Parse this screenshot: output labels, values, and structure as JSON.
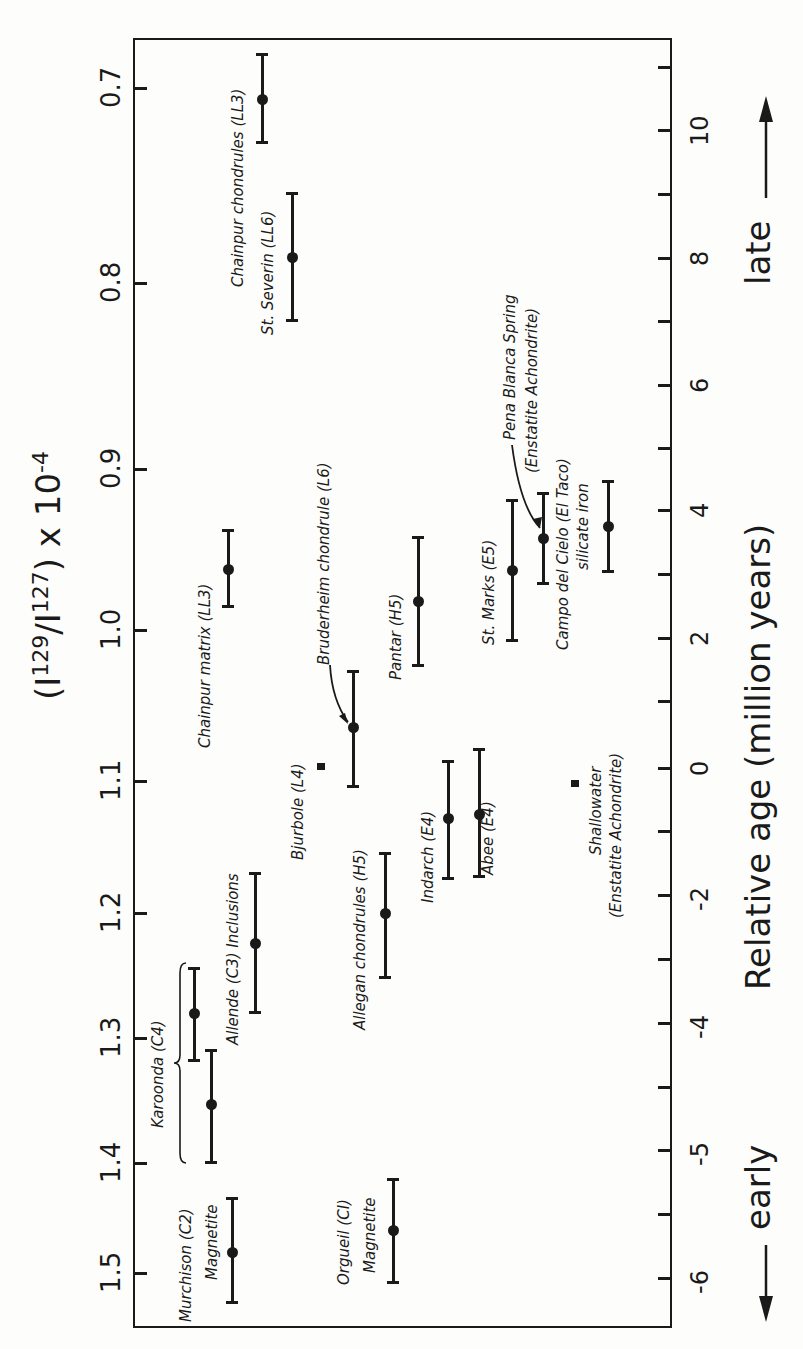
{
  "chart_data": {
    "type": "scatter",
    "title": "",
    "orientation": "rotated -90deg (figure printed sideways)",
    "left_axis": {
      "label": "(I129/I127) x 10^-4",
      "label_parts": {
        "open": "(I",
        "sup1": "129",
        "mid": "/I",
        "sup2": "127",
        "close": ") x 10",
        "sup3": "-4"
      },
      "ticks": [
        {
          "label": "0.7",
          "y": 88
        },
        {
          "label": "0.8",
          "y": 283
        },
        {
          "label": "0.9",
          "y": 469
        },
        {
          "label": "1.0",
          "y": 630
        },
        {
          "label": "1.1",
          "y": 781
        },
        {
          "label": "1.2",
          "y": 913
        },
        {
          "label": "1.3",
          "y": 1038
        },
        {
          "label": "1.4",
          "y": 1163
        },
        {
          "label": "1.5",
          "y": 1273
        }
      ],
      "range": [
        0.68,
        1.52
      ]
    },
    "right_axis": {
      "label": "Relative age (million years)",
      "late_label": "late",
      "early_label": "early",
      "ticks": [
        {
          "label": "",
          "y": 67
        },
        {
          "label": "10",
          "y": 130
        },
        {
          "label": "",
          "y": 194
        },
        {
          "label": "8",
          "y": 258
        },
        {
          "label": "",
          "y": 321
        },
        {
          "label": "6",
          "y": 385
        },
        {
          "label": "",
          "y": 448
        },
        {
          "label": "4",
          "y": 510
        },
        {
          "label": "",
          "y": 574
        },
        {
          "label": "2",
          "y": 638
        },
        {
          "label": "",
          "y": 701
        },
        {
          "label": "0",
          "y": 768
        },
        {
          "label": "",
          "y": 831
        },
        {
          "label": "-2",
          "y": 895
        },
        {
          "label": "",
          "y": 959
        },
        {
          "label": "-4",
          "y": 1023
        },
        {
          "label": "",
          "y": 1087
        },
        {
          "label": "-5",
          "y": 1150
        },
        {
          "label": "",
          "y": 1214
        },
        {
          "label": "-6",
          "y": 1278
        }
      ]
    },
    "grid": false,
    "legend": null,
    "points": [
      {
        "name": "Chainpur chondrules (LL3)",
        "ratio": 0.705,
        "ratio_err": [
          0.68,
          0.73
        ],
        "age_myr": 10.5,
        "x": 262,
        "y": 99,
        "top": 54,
        "bot": 142,
        "marker": "dot",
        "labels": [
          {
            "text": "Chainpur chondrules (LL3)",
            "x": 230,
            "y": 287
          }
        ]
      },
      {
        "name": "St. Severin (LL6)",
        "ratio": 0.79,
        "ratio_err": [
          0.755,
          0.825
        ],
        "age_myr": 8.0,
        "x": 292,
        "y": 257,
        "top": 193,
        "bot": 320,
        "marker": "dot",
        "labels": [
          {
            "text": "St. Severin (LL6)",
            "x": 260,
            "y": 335
          }
        ]
      },
      {
        "name": "Chainpur matrix (LL3)",
        "ratio": 0.965,
        "ratio_err": [
          0.94,
          0.985
        ],
        "age_myr": 3.0,
        "x": 228,
        "y": 569,
        "top": 530,
        "bot": 606,
        "marker": "dot",
        "labels": [
          {
            "text": "Chainpur matrix (LL3)",
            "x": 197,
            "y": 748
          }
        ]
      },
      {
        "name": "Bruderheim chondrule (L6)",
        "ratio": 1.065,
        "ratio_err": [
          1.03,
          1.105
        ],
        "age_myr": 0.6,
        "x": 353,
        "y": 727,
        "top": 671,
        "bot": 786,
        "marker": "dot",
        "labels": [
          {
            "text": "Bruderheim chondrule (L6)",
            "x": 316,
            "y": 665
          }
        ]
      },
      {
        "name": "Bjurbole (L4)",
        "ratio": 1.09,
        "ratio_err": [
          1.088,
          1.092
        ],
        "age_myr": 0.0,
        "x": 321,
        "y": 766,
        "top": 766,
        "bot": 766,
        "marker": "square",
        "labels": [
          {
            "text": "Bjurbole (L4)",
            "x": 290,
            "y": 860
          }
        ]
      },
      {
        "name": "Pantar (H5)",
        "ratio": 0.98,
        "ratio_err": [
          0.945,
          1.02
        ],
        "age_myr": 2.6,
        "x": 418,
        "y": 601,
        "top": 537,
        "bot": 665,
        "marker": "dot",
        "labels": [
          {
            "text": "Pantar (H5)",
            "x": 388,
            "y": 680
          }
        ]
      },
      {
        "name": "Allegan chondrules (H5)",
        "ratio": 1.2,
        "ratio_err": [
          1.155,
          1.25
        ],
        "age_myr": -2.3,
        "x": 385,
        "y": 913,
        "top": 853,
        "bot": 977,
        "marker": "dot",
        "labels": [
          {
            "text": "Allegan chondrules (H5)",
            "x": 352,
            "y": 1030
          }
        ]
      },
      {
        "name": "Indarch (E4)",
        "ratio": 1.125,
        "ratio_err": [
          1.09,
          1.17
        ],
        "age_myr": -0.8,
        "x": 448,
        "y": 818,
        "top": 761,
        "bot": 878,
        "marker": "dot",
        "labels": [
          {
            "text": "Indarch (E4)",
            "x": 420,
            "y": 903
          }
        ]
      },
      {
        "name": "Abee (E4)",
        "ratio": 1.12,
        "ratio_err": [
          1.08,
          1.17
        ],
        "age_myr": -0.7,
        "x": 479,
        "y": 814,
        "top": 749,
        "bot": 876,
        "marker": "dot",
        "labels": [
          {
            "text": "Abee (E4)",
            "x": 480,
            "y": 875
          }
        ]
      },
      {
        "name": "St. Marks (E5)",
        "ratio": 0.965,
        "ratio_err": [
          0.92,
          1.005
        ],
        "age_myr": 3.1,
        "x": 512,
        "y": 570,
        "top": 500,
        "bot": 640,
        "marker": "dot",
        "labels": [
          {
            "text": "St. Marks (E5)",
            "x": 481,
            "y": 645
          }
        ]
      },
      {
        "name": "Pena Blanca Spring (Enstatite Achondrite)",
        "ratio": 0.945,
        "ratio_err": [
          0.915,
          0.975
        ],
        "age_myr": 3.6,
        "x": 543,
        "y": 538,
        "top": 493,
        "bot": 583,
        "marker": "dot",
        "labels": [
          {
            "text": "Pena Blanca Spring",
            "x": 502,
            "y": 440
          },
          {
            "text": "(Enstatite Achondrite)",
            "x": 524,
            "y": 473
          }
        ],
        "arrow": {
          "from": [
            512,
            445
          ],
          "to": [
            540,
            528
          ]
        }
      },
      {
        "name": "Campo del Cielo (El Taco) silicate iron",
        "ratio": 0.935,
        "ratio_err": [
          0.905,
          0.965
        ],
        "age_myr": 3.8,
        "x": 608,
        "y": 526,
        "top": 481,
        "bot": 571,
        "marker": "dot",
        "labels": [
          {
            "text": "Campo del Cielo (El Taco)",
            "x": 555,
            "y": 650
          },
          {
            "text": "silicate iron",
            "x": 575,
            "y": 570
          }
        ]
      },
      {
        "name": "Shallowater (Enstatite Achondrite)",
        "ratio": 1.1,
        "ratio_err": [
          1.098,
          1.102
        ],
        "age_myr": -0.2,
        "x": 575,
        "y": 783,
        "top": 783,
        "bot": 783,
        "marker": "square",
        "labels": [
          {
            "text": "Shallowater",
            "x": 588,
            "y": 855
          },
          {
            "text": "(Enstatite Achondrite)",
            "x": 608,
            "y": 918
          }
        ]
      },
      {
        "name": "Allende (C3) Inclusions",
        "ratio": 1.225,
        "ratio_err": [
          1.17,
          1.28
        ],
        "age_myr": -2.8,
        "x": 255,
        "y": 943,
        "top": 873,
        "bot": 1012,
        "marker": "dot",
        "labels": [
          {
            "text": "Allende (C3) Inclusions",
            "x": 225,
            "y": 1045
          }
        ]
      },
      {
        "name": "Karoonda (C4) #1",
        "ratio": 1.28,
        "ratio_err": [
          1.245,
          1.315
        ],
        "age_myr": -3.8,
        "x": 194,
        "y": 1013,
        "top": 968,
        "bot": 1060,
        "marker": "dot",
        "labels": []
      },
      {
        "name": "Karoonda (C4) #2",
        "ratio": 1.35,
        "ratio_err": [
          1.31,
          1.4
        ],
        "age_myr": -4.6,
        "x": 211,
        "y": 1104,
        "top": 1050,
        "bot": 1162,
        "marker": "dot",
        "labels": []
      },
      {
        "name": "Murchison (C2) Magnetite",
        "ratio": 1.47,
        "ratio_err": [
          1.43,
          1.505
        ],
        "age_myr": -5.8,
        "x": 232,
        "y": 1252,
        "top": 1198,
        "bot": 1302,
        "marker": "dot",
        "labels": [
          {
            "text": "Murchison (C2)",
            "x": 178,
            "y": 1322
          },
          {
            "text": "Magnetite",
            "x": 204,
            "y": 1280
          }
        ]
      },
      {
        "name": "Orgueil (CI) Magnetite",
        "ratio": 1.45,
        "ratio_err": [
          1.415,
          1.495
        ],
        "age_myr": -5.6,
        "x": 393,
        "y": 1230,
        "top": 1179,
        "bot": 1282,
        "marker": "dot",
        "labels": [
          {
            "text": "Orgueil (CI)",
            "x": 336,
            "y": 1285
          },
          {
            "text": "Magnetite",
            "x": 362,
            "y": 1273
          }
        ]
      }
    ],
    "group_annotations": [
      {
        "text": "Karoonda (C4)",
        "x": 150,
        "y": 1128,
        "brace": {
          "x": 180,
          "top": 963,
          "bot": 1163
        }
      }
    ]
  }
}
